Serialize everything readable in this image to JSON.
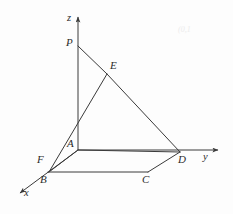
{
  "figure": {
    "kind": "3d-coordinate-geometry-diagram",
    "canvas": {
      "width": 233,
      "height": 214,
      "background": "#fdfdfd"
    },
    "stroke_color": "#3a3a3a",
    "label_color": "#2b2b2b",
    "axes": [
      {
        "name": "z",
        "label": "z",
        "label_x": 67,
        "label_y": 14,
        "x1": 78,
        "y1": 150,
        "x2": 78,
        "y2": 17,
        "arrow": true
      },
      {
        "name": "y",
        "label": "y",
        "label_x": 203,
        "label_y": 155,
        "x1": 78,
        "y1": 150,
        "x2": 225,
        "y2": 150,
        "arrow": true
      },
      {
        "name": "x",
        "label": "x",
        "label_x": 24,
        "label_y": 190,
        "x1": 78,
        "y1": 150,
        "x2": 16,
        "y2": 196,
        "arrow": true
      }
    ],
    "points": [
      {
        "name": "P",
        "label": "P",
        "x": 78,
        "y": 46,
        "label_x": 66,
        "label_y": 38
      },
      {
        "name": "E",
        "label": "E",
        "x": 107,
        "y": 74,
        "label_x": 110,
        "label_y": 62
      },
      {
        "name": "A",
        "label": "A",
        "x": 78,
        "y": 150,
        "label_x": 68,
        "label_y": 140
      },
      {
        "name": "D",
        "label": "D",
        "x": 180,
        "y": 152,
        "label_x": 179,
        "label_y": 155
      },
      {
        "name": "F",
        "label": "F",
        "x": 49,
        "y": 172,
        "label_x": 38,
        "label_y": 156
      },
      {
        "name": "B",
        "label": "B",
        "x": 48,
        "y": 173,
        "label_x": 41,
        "label_y": 176
      },
      {
        "name": "C",
        "label": "C",
        "x": 148,
        "y": 172,
        "label_x": 143,
        "label_y": 176
      }
    ],
    "segments": [
      {
        "name": "P-E",
        "x1": 78,
        "y1": 46,
        "x2": 107,
        "y2": 74
      },
      {
        "name": "E-D",
        "x1": 107,
        "y1": 74,
        "x2": 180,
        "y2": 152
      },
      {
        "name": "F-E",
        "x1": 49,
        "y1": 172,
        "x2": 107,
        "y2": 74
      },
      {
        "name": "F-A",
        "x1": 49,
        "y1": 172,
        "x2": 78,
        "y2": 150
      },
      {
        "name": "A-D",
        "x1": 78,
        "y1": 150,
        "x2": 180,
        "y2": 152
      },
      {
        "name": "D-C",
        "x1": 180,
        "y1": 152,
        "x2": 148,
        "y2": 172
      },
      {
        "name": "C-B",
        "x1": 148,
        "y1": 172,
        "x2": 48,
        "y2": 172
      },
      {
        "name": "B-F",
        "x1": 48,
        "y1": 172,
        "x2": 49,
        "y2": 172
      }
    ],
    "artifacts": [
      {
        "name": "faint-scan-mark",
        "text": "(0,1",
        "x": 178,
        "y": 28
      }
    ]
  }
}
